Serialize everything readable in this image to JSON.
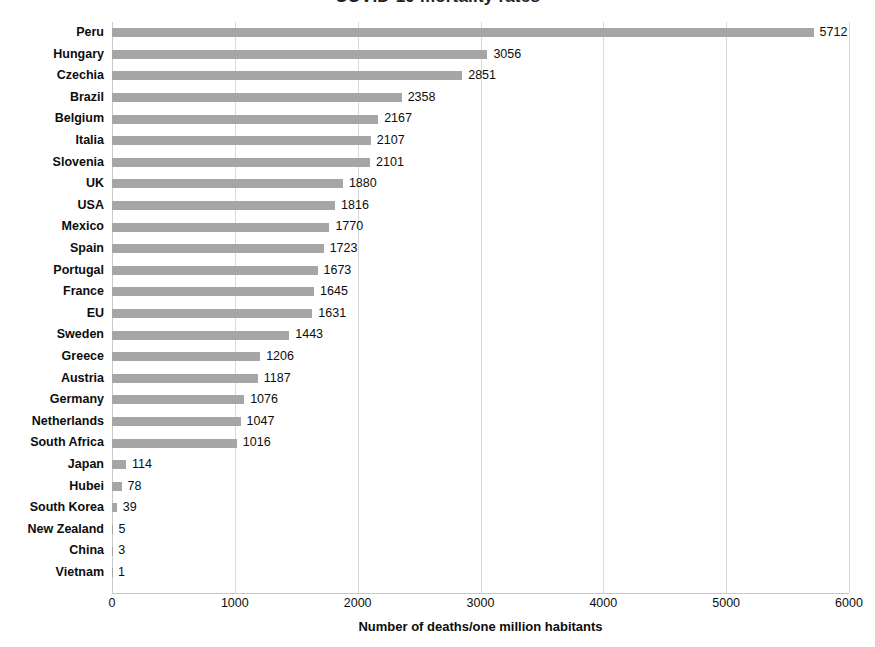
{
  "chart_data": {
    "type": "bar",
    "orientation": "horizontal",
    "title": "COVID-19 mortality rates",
    "xlabel": "Number of deaths/one million habitants",
    "ylabel": "",
    "xlim": [
      0,
      6000
    ],
    "xticks": [
      0,
      1000,
      2000,
      3000,
      4000,
      5000,
      6000
    ],
    "xtick_labels": [
      "0",
      "1000",
      "2000",
      "3000",
      "4000",
      "5000",
      "6000"
    ],
    "grid": "vertical",
    "legend": "none",
    "bar_color": "#a6a6a6",
    "categories": [
      "Peru",
      "Hungary",
      "Czechia",
      "Brazil",
      "Belgium",
      "Italia",
      "Slovenia",
      "UK",
      "USA",
      "Mexico",
      "Spain",
      "Portugal",
      "France",
      "EU",
      "Sweden",
      "Greece",
      "Austria",
      "Germany",
      "Netherlands",
      "South Africa",
      "Japan",
      "Hubei",
      "South Korea",
      "New Zealand",
      "China",
      "Vietnam"
    ],
    "values": [
      5712,
      3056,
      2851,
      2358,
      2167,
      2107,
      2101,
      1880,
      1816,
      1770,
      1723,
      1673,
      1645,
      1631,
      1443,
      1206,
      1187,
      1076,
      1047,
      1016,
      114,
      78,
      39,
      5,
      3,
      1
    ],
    "value_labels": [
      "5712",
      "3056",
      "2851",
      "2358",
      "2167",
      "2107",
      "2101",
      "1880",
      "1816",
      "1770",
      "1723",
      "1673",
      "1645",
      "1631",
      "1443",
      "1206",
      "1187",
      "1076",
      "1047",
      "1016",
      "114",
      "78",
      "39",
      "5",
      "3",
      "1"
    ]
  }
}
